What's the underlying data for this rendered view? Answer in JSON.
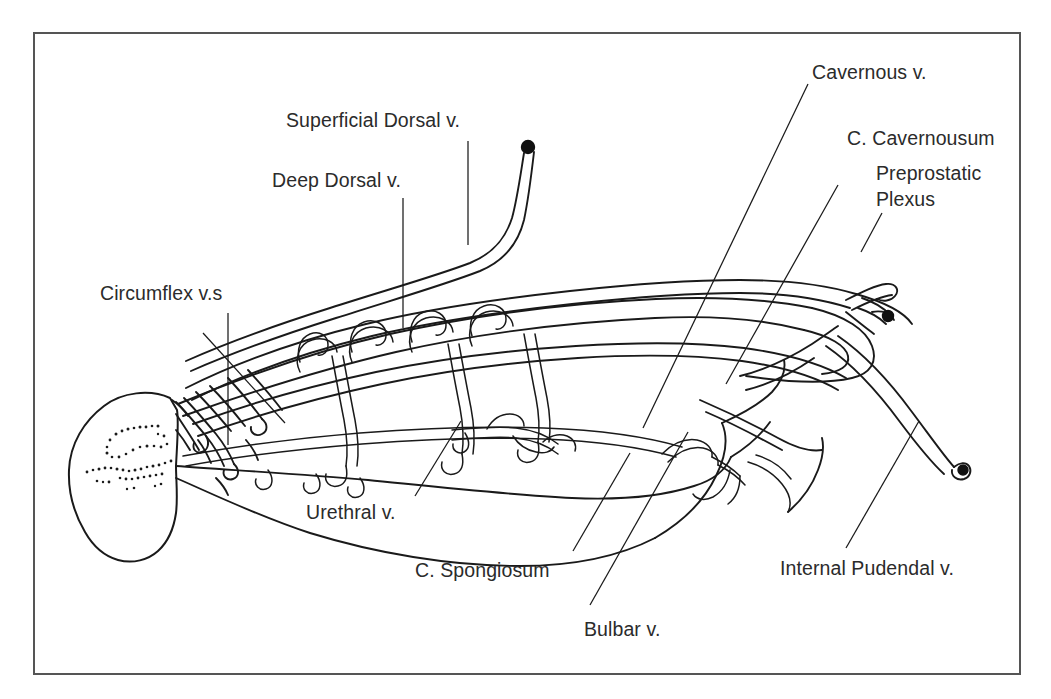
{
  "figure": {
    "kind": "anatomical-line-diagram",
    "background_color": "#ffffff",
    "ink_color": "#1a1a1a",
    "text_color": "#2b2b2b",
    "frame": {
      "name": "figure-border",
      "color": "#555555",
      "x": 34,
      "y": 33,
      "width": 986,
      "height": 641
    }
  },
  "labels": [
    {
      "id": "superficial-dorsal-v",
      "text": "Superficial Dorsal v.",
      "x": 286,
      "y": 108,
      "leader": "vertical"
    },
    {
      "id": "deep-dorsal-v",
      "text": "Deep Dorsal v.",
      "x": 272,
      "y": 168,
      "leader": "vertical"
    },
    {
      "id": "circumflex-vs",
      "text": "Circumflex v.s",
      "x": 100,
      "y": 281,
      "leader": "vertical-plus-diagonal"
    },
    {
      "id": "urethral-v",
      "text": "Urethral v.",
      "x": 306,
      "y": 500,
      "leader": "diagonal"
    },
    {
      "id": "c-spongiosum",
      "text": "C. Spongiosum",
      "x": 415,
      "y": 558,
      "leader": "diagonal"
    },
    {
      "id": "bulbar-v",
      "text": "Bulbar v.",
      "x": 584,
      "y": 617,
      "leader": "diagonal"
    },
    {
      "id": "internal-pudendal-v",
      "text": "Internal Pudendal v.",
      "x": 780,
      "y": 556,
      "leader": "diagonal"
    },
    {
      "id": "preprostatic-plexus",
      "text": "Preprostatic\nPlexus",
      "x": 876,
      "y": 160,
      "leader": "diagonal"
    },
    {
      "id": "c-cavernousum",
      "text": "C. Cavernousum",
      "x": 847,
      "y": 126,
      "leader": "diagonal"
    },
    {
      "id": "cavernous-v",
      "text": "Cavernous v.",
      "x": 812,
      "y": 60,
      "leader": "diagonal"
    }
  ],
  "leader_lines": [
    {
      "id": "leader-superficial-dorsal",
      "from": [
        468,
        141
      ],
      "to": [
        468,
        245
      ]
    },
    {
      "id": "leader-deep-dorsal",
      "from": [
        403,
        198
      ],
      "to": [
        403,
        328
      ]
    },
    {
      "id": "leader-circumflex-vertical",
      "from": [
        228,
        313
      ],
      "to": [
        228,
        445
      ]
    },
    {
      "id": "leader-circumflex-diagonal",
      "from": [
        203,
        333
      ],
      "to": [
        285,
        423
      ]
    },
    {
      "id": "leader-urethral",
      "from": [
        415,
        496
      ],
      "to": [
        461,
        421
      ]
    },
    {
      "id": "leader-spongiosum",
      "from": [
        573,
        551
      ],
      "to": [
        630,
        453
      ]
    },
    {
      "id": "leader-bulbar",
      "from": [
        590,
        605
      ],
      "to": [
        688,
        432
      ]
    },
    {
      "id": "leader-pudendal",
      "from": [
        846,
        548
      ],
      "to": [
        919,
        421
      ]
    },
    {
      "id": "leader-preprostatic",
      "from": [
        882,
        213
      ],
      "to": [
        861,
        252
      ]
    },
    {
      "id": "leader-cavernousum",
      "from": [
        838,
        185
      ],
      "to": [
        726,
        384
      ]
    },
    {
      "id": "leader-cavernous",
      "from": [
        808,
        84
      ],
      "to": [
        643,
        428
      ]
    }
  ],
  "anatomy_markers": [
    {
      "id": "superficial-dorsal-tip-dot",
      "x": 525,
      "y": 147
    },
    {
      "id": "preprostatic-tip-dot",
      "x": 888,
      "y": 316
    },
    {
      "id": "internal-pudendal-tip-dot",
      "x": 965,
      "y": 468
    }
  ]
}
